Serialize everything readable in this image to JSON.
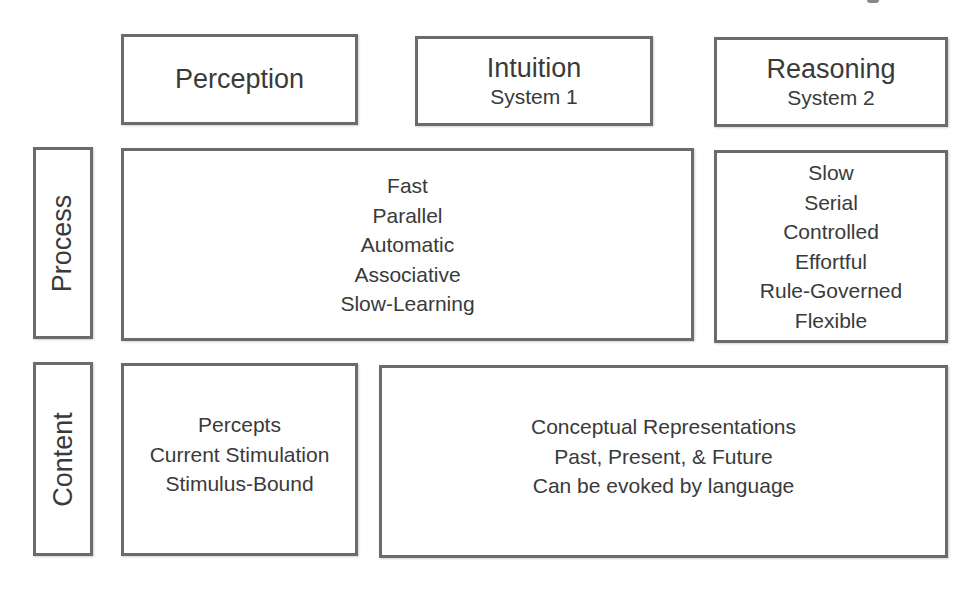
{
  "diagram": {
    "columns": [
      {
        "id": "perception",
        "title": "Perception",
        "subtitle": ""
      },
      {
        "id": "intuition",
        "title": "Intuition",
        "subtitle": "System 1"
      },
      {
        "id": "reasoning",
        "title": "Reasoning",
        "subtitle": "System 2"
      }
    ],
    "rows": [
      {
        "id": "process",
        "label": "Process"
      },
      {
        "id": "content",
        "label": "Content"
      }
    ],
    "cells": {
      "process_system1": {
        "spans": [
          "Perception",
          "Intuition"
        ],
        "lines": [
          "Fast",
          "Parallel",
          "Automatic",
          "Associative",
          "Slow-Learning"
        ]
      },
      "process_system2": {
        "spans": [
          "Reasoning"
        ],
        "lines": [
          "Slow",
          "Serial",
          "Controlled",
          "Effortful",
          "Rule-Governed",
          "Flexible"
        ]
      },
      "content_perception": {
        "spans": [
          "Perception"
        ],
        "lines": [
          "Percepts",
          "Current Stimulation",
          "Stimulus-Bound"
        ]
      },
      "content_conceptual": {
        "spans": [
          "Intuition",
          "Reasoning"
        ],
        "lines": [
          "Conceptual Representations",
          "Past, Present, & Future",
          "Can be evoked by language"
        ]
      }
    }
  },
  "colors": {
    "border": "#6b6b6b",
    "text": "#3a3a3a",
    "background": "#ffffff"
  }
}
